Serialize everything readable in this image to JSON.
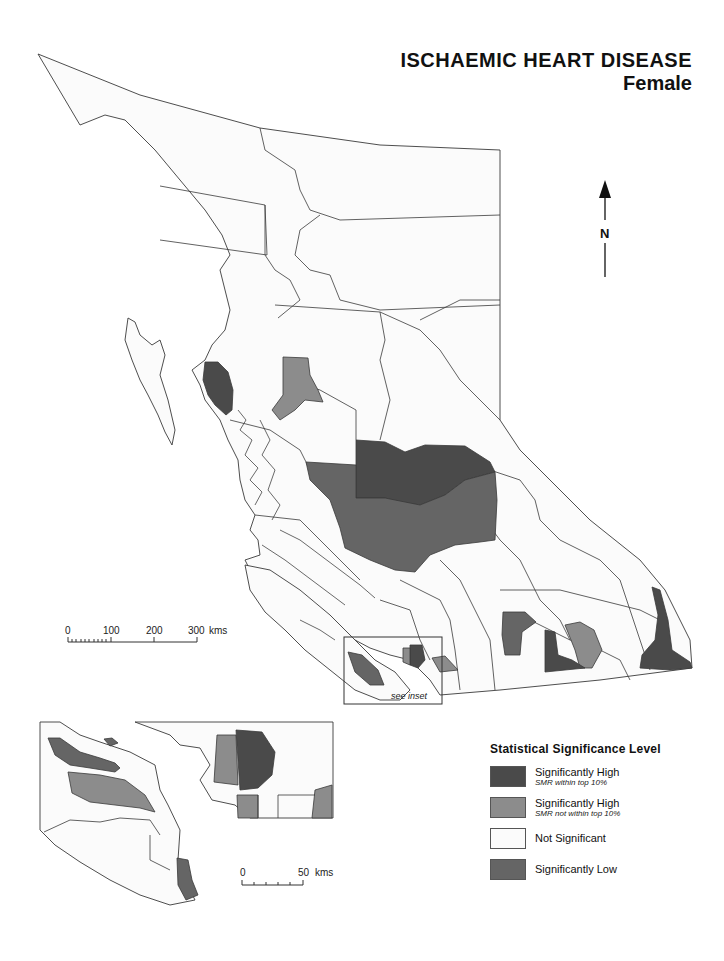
{
  "title": {
    "main": "ISCHAEMIC HEART DISEASE",
    "subtitle": "Female"
  },
  "north_arrow": {
    "label": "N",
    "icon": "north-arrow-icon"
  },
  "scale_main": {
    "ticks": [
      "0",
      "100",
      "200",
      "300"
    ],
    "unit": "kms"
  },
  "scale_inset": {
    "ticks": [
      "0",
      "50"
    ],
    "unit": "kms"
  },
  "inset_note": "see inset",
  "colors": {
    "sig_high_top10": "#4a4a4a",
    "sig_high_not_top10": "#8c8c8c",
    "not_significant": "#fbfbfb",
    "sig_low": "#656565",
    "outline": "#3a3a3a"
  },
  "legend": {
    "title": "Statistical Significance Level",
    "items": [
      {
        "label": "Significantly High",
        "sublabel": "SMR within top 10%",
        "color": "#4a4a4a"
      },
      {
        "label": "Significantly High",
        "sublabel": "SMR not within top 10%",
        "color": "#8c8c8c"
      },
      {
        "label": "Not Significant",
        "sublabel": "",
        "color": "#fbfbfb"
      },
      {
        "label": "Significantly Low",
        "sublabel": "",
        "color": "#656565"
      }
    ]
  }
}
